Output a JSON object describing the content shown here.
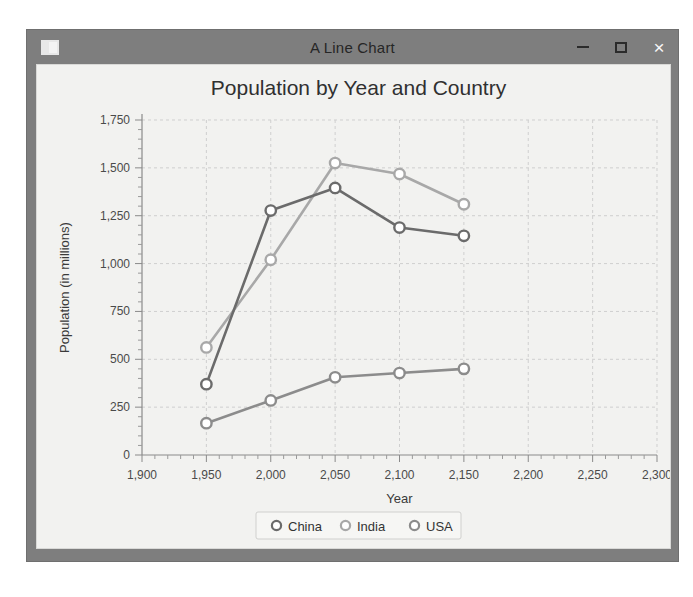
{
  "window": {
    "title": "A Line Chart",
    "icon": "window-icon",
    "controls": {
      "minimize": "–",
      "maximize": "□",
      "close": "×"
    }
  },
  "chart_data": {
    "type": "line",
    "title": "Population by Year and Country",
    "xlabel": "Year",
    "ylabel": "Population (in millions)",
    "x": [
      1950,
      2000,
      2050,
      2100,
      2150
    ],
    "xlim": [
      1900,
      2300
    ],
    "ylim": [
      0,
      1750
    ],
    "xticks": [
      1900,
      1950,
      2000,
      2050,
      2100,
      2150,
      2200,
      2250,
      2300
    ],
    "xtick_labels": [
      "1,900",
      "1,950",
      "2,000",
      "2,050",
      "2,100",
      "2,150",
      "2,200",
      "2,250",
      "2,300"
    ],
    "yticks": [
      0,
      250,
      500,
      750,
      1000,
      1250,
      1500,
      1750
    ],
    "ytick_labels": [
      "0",
      "250",
      "500",
      "750",
      "1,000",
      "1,250",
      "1,500",
      "1,750"
    ],
    "grid": true,
    "legend_position": "bottom",
    "marker": "circle-open",
    "series": [
      {
        "name": "China",
        "color": "#6b6b6b",
        "values": [
          370,
          1277,
          1395,
          1188,
          1145
        ]
      },
      {
        "name": "India",
        "color": "#a8a8a8",
        "values": [
          562,
          1020,
          1525,
          1468,
          1310
        ]
      },
      {
        "name": "USA",
        "color": "#8c8c8c",
        "values": [
          166,
          285,
          406,
          428,
          450
        ]
      }
    ]
  }
}
